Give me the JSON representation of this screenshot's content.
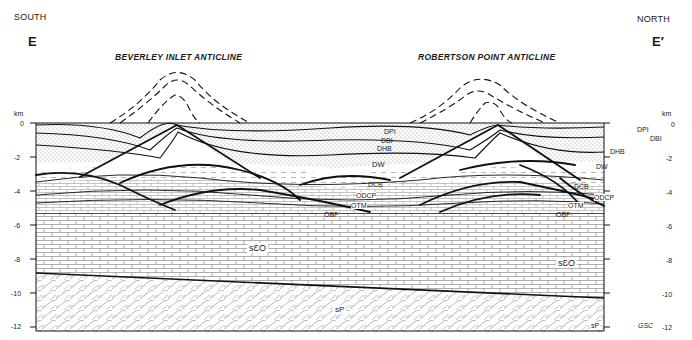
{
  "header": {
    "left_direction": "SOUTH",
    "right_direction": "NORTH",
    "left_section": "E",
    "right_section": "E′"
  },
  "anticlines": [
    {
      "name": "BEVERLEY INLET ANTICLINE"
    },
    {
      "name": "ROBERTSON POINT ANTICLINE"
    }
  ],
  "axis": {
    "unit": "km",
    "ticks": [
      "0",
      "-2",
      "-4",
      "-6",
      "-8",
      "-10",
      "-12"
    ]
  },
  "units": {
    "DPI": "DPI",
    "DBI": "DBI",
    "DHB": "DHB",
    "DW": "DW",
    "DCB": "DCB",
    "ODCP": "ODCP",
    "OTM": "OTM",
    "OBF": "OBF",
    "sCO": "sƐO",
    "sP": "sP"
  },
  "credit": "GSC",
  "colors": {
    "ink": "#1a1a1a",
    "stipple": "#c9c9c9",
    "background": "#ffffff"
  }
}
